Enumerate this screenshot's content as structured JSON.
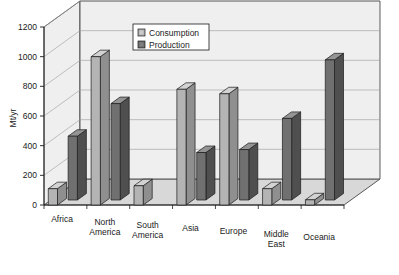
{
  "chart_data": {
    "type": "bar",
    "title": "",
    "subtitle": "",
    "xlabel": "",
    "ylabel": "Mt/yr",
    "ylim": [
      0,
      1200
    ],
    "ytick_step": 200,
    "yticks": [
      "0",
      "200",
      "400",
      "600",
      "800",
      "1000",
      "1200"
    ],
    "grid": true,
    "three_d": true,
    "legend_position": "top-center",
    "categories": [
      "Africa",
      "North America",
      "South America",
      "Asia",
      "Europe",
      "Middle East",
      "Oceania"
    ],
    "category_lines": [
      [
        "Africa"
      ],
      [
        "North",
        "America"
      ],
      [
        "South",
        "America"
      ],
      [
        "Asia"
      ],
      [
        "Europe"
      ],
      [
        "Middle",
        "East"
      ],
      [
        "Oceania"
      ]
    ],
    "series": [
      {
        "name": "Consumption",
        "color": "#b0b0b0",
        "values": [
          110,
          1000,
          130,
          780,
          750,
          110,
          35
        ]
      },
      {
        "name": "Production",
        "color": "#6e6e6e",
        "values": [
          430,
          650,
          0,
          320,
          340,
          550,
          945
        ]
      }
    ]
  },
  "legend": {
    "items": [
      {
        "label": "Consumption",
        "swatch": "#b0b0b0"
      },
      {
        "label": "Production",
        "swatch": "#6e6e6e"
      }
    ]
  },
  "colors": {
    "consumption_front": "#b4b4b4",
    "consumption_top": "#d2d2d2",
    "consumption_side": "#8f8f8f",
    "production_front": "#707070",
    "production_top": "#949494",
    "production_side": "#4f4f4f",
    "floor": "#d8d8d8",
    "backwall": "#efefef",
    "outline": "#1a1a1a",
    "grid": "#9a9a9a"
  }
}
